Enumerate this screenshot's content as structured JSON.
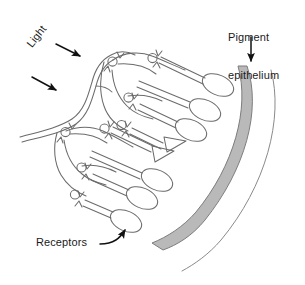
{
  "figure": {
    "background_color": "#ffffff",
    "width": 305,
    "height": 285
  },
  "labels": {
    "pigment_epithelium": "Pigment\nepithelium",
    "pigment_epithelium_line1": "Pigment",
    "pigment_epithelium_line2": "epithelium",
    "light": "Light",
    "receptors": "Receptors"
  },
  "colors": {
    "stroke": "#6b6b6b",
    "text": "#1a1a1a",
    "arrow": "#111111",
    "pigment_band_fill": "#b9b9b9",
    "pigment_band_edge": "#8a8a8a",
    "background": "#ffffff"
  },
  "annotations": {
    "light_arrow_1": "arrow pointing down-right into inner retina",
    "light_arrow_2": "arrow pointing down-right into inner retina",
    "pigment_arrow": "arrow pointing down to pigment epithelium band",
    "receptors_arrow": "curved arrow pointing up-right to a receptor cell"
  },
  "structures": {
    "pigment_epithelium_band": "pigment-epithelium-band",
    "sclera_arc": "outer-arc-line",
    "inner_limiting_membrane": "inner-retinal-surface-double-line",
    "receptor_cells": "elongated rod and cone outer segments",
    "cone_markers": "triangles",
    "rod_markers": "ellipses",
    "neuron_nuclei": "small circles (bipolar / ganglion cell bodies)"
  }
}
